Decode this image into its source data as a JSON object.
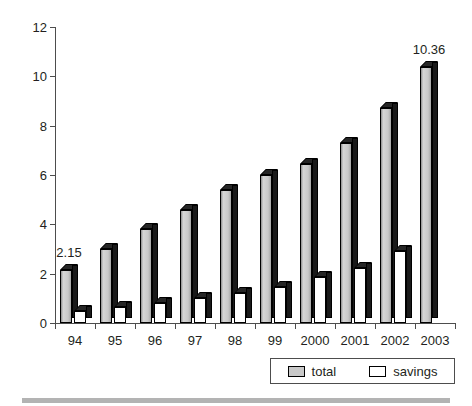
{
  "chart_data": {
    "type": "bar",
    "title": "",
    "subtitle": "",
    "xlabel": "",
    "ylabel": "",
    "categories": [
      "94",
      "95",
      "96",
      "97",
      "98",
      "99",
      "2000",
      "2001",
      "2002",
      "2003"
    ],
    "series": [
      {
        "name": "total",
        "color": "#c9c9c9",
        "values": [
          2.15,
          3.0,
          3.8,
          4.6,
          5.4,
          6.0,
          6.45,
          7.3,
          8.7,
          10.36
        ]
      },
      {
        "name": "savings",
        "color": "#ffffff",
        "values": [
          0.5,
          0.65,
          0.8,
          1.0,
          1.2,
          1.45,
          1.85,
          2.25,
          2.9,
          null
        ]
      }
    ],
    "point_labels": [
      {
        "series": "total",
        "category": "94",
        "text": "2.15"
      },
      {
        "series": "total",
        "category": "2003",
        "text": "10.36"
      }
    ],
    "ylim": [
      0,
      12
    ],
    "ytick_values": [
      0,
      2,
      4,
      6,
      8,
      10,
      12
    ],
    "ytick_labels": [
      "0",
      "2",
      "4",
      "6",
      "8",
      "10",
      "12"
    ],
    "grid": false,
    "legend_position": "bottom-right",
    "bar_style": "3d-shadow"
  },
  "legend": {
    "entries": [
      {
        "label": "total",
        "swatch": "#c9c9c9"
      },
      {
        "label": "savings",
        "swatch": "#ffffff"
      }
    ]
  }
}
